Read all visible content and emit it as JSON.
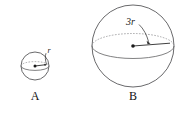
{
  "figure": {
    "background_color": "#ffffff",
    "outline_color": "#58585a",
    "dash_color": "#8d8d90",
    "label_color": "#1a1a1a"
  },
  "sphere_a": {
    "caption": "A",
    "radius_label": "r",
    "center_x": 35,
    "center_y": 66,
    "radius_px": 14,
    "radius_line_label_position": "upper-right"
  },
  "sphere_b": {
    "caption": "B",
    "radius_label": "3r",
    "center_x": 133,
    "center_y": 46,
    "radius_px": 41,
    "radius_line_label_position": "upper-right"
  }
}
